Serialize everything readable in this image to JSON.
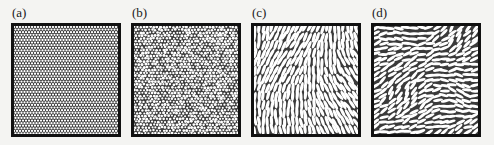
{
  "figure": {
    "panels": [
      {
        "id": "a",
        "label": "(a)",
        "pattern": "hexagonal-disks",
        "left": 11
      },
      {
        "id": "b",
        "label": "(b)",
        "pattern": "polydisperse-disks",
        "left": 131
      },
      {
        "id": "c",
        "label": "(c)",
        "pattern": "aligned-ellipses",
        "left": 251
      },
      {
        "id": "d",
        "label": "(d)",
        "pattern": "disordered-ellipses",
        "left": 371
      }
    ]
  },
  "colors": {
    "border": "#111111",
    "particle_fill": "#ffffff",
    "gap": "#3a3a3a",
    "background": "#f4f4f2"
  }
}
